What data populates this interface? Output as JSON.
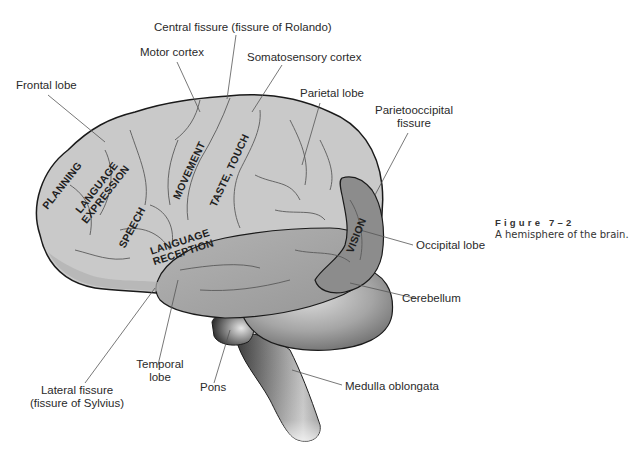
{
  "figure": {
    "number": "Figure 7–2",
    "caption": "A hemisphere of the brain."
  },
  "labels": {
    "central_fissure": "Central fissure (fissure of Rolando)",
    "motor_cortex": "Motor cortex",
    "somatosensory_cortex": "Somatosensory cortex",
    "frontal_lobe": "Frontal lobe",
    "parietal_lobe": "Parietal lobe",
    "parietooccipital_fissure_line1": "Parietooccipital",
    "parietooccipital_fissure_line2": "fissure",
    "occipital_lobe": "Occipital lobe",
    "cerebellum": "Cerebellum",
    "temporal_lobe_line1": "Temporal",
    "temporal_lobe_line2": "lobe",
    "pons": "Pons",
    "medulla_oblongata": "Medulla oblongata",
    "lateral_fissure_line1": "Lateral fissure",
    "lateral_fissure_line2": "(fissure of Sylvius)"
  },
  "regions": {
    "planning": "PLANNING",
    "language_expression_line1": "LANGUAGE",
    "language_expression_line2": "EXPRESSION",
    "speech": "SPEECH",
    "movement": "MOVEMENT",
    "taste_touch": "TASTE, TOUCH",
    "language_reception_line1": "LANGUAGE",
    "language_reception_line2": "RECEPTION",
    "vision": "VISION"
  },
  "colors": {
    "cortex_light": "#c9c9c9",
    "temporal_mid": "#a9a9a9",
    "occipital_dark": "#8c8c8c",
    "outline": "#1a1a1a",
    "leader_line": "#555555"
  }
}
